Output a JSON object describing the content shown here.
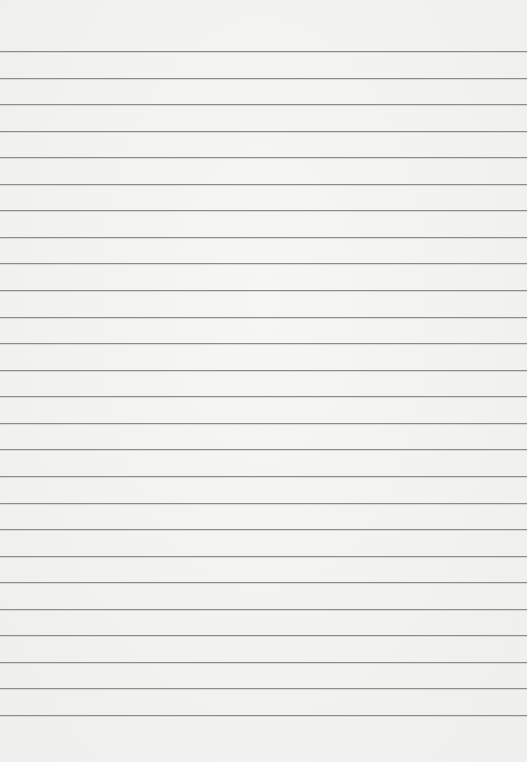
{
  "paper": {
    "type": "lined-paper",
    "background_color": "#f2f2f1",
    "line_color": "#8c8c8c",
    "first_line_y": 51,
    "line_spacing": 26.56,
    "line_count": 26
  }
}
